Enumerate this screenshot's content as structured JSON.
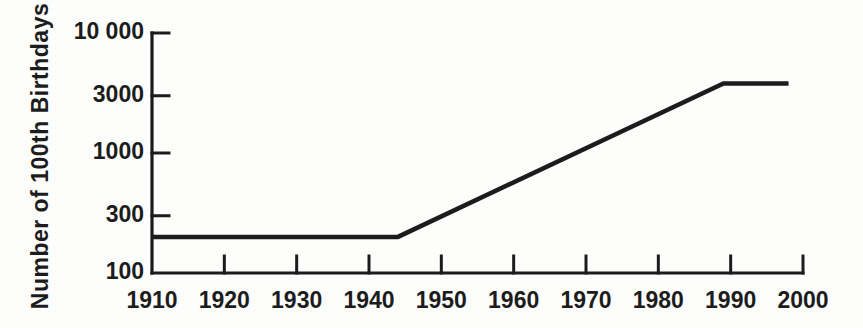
{
  "figure": {
    "background": "#fdfdfc",
    "ink_color": "#1c1c1c"
  },
  "chart_data": {
    "type": "line",
    "title": "",
    "xlabel": "",
    "ylabel": "Number of 100th Birthdays",
    "grid": false,
    "legend": false,
    "x_axis": {
      "scale": "linear",
      "range": [
        1910,
        2000
      ],
      "tick_values": [
        1910,
        1920,
        1930,
        1940,
        1950,
        1960,
        1970,
        1980,
        1990,
        2000
      ],
      "tick_labels": [
        "1910",
        "1920",
        "1930",
        "1940",
        "1950",
        "1960",
        "1970",
        "1980",
        "1990",
        "2000"
      ]
    },
    "y_axis": {
      "scale": "log",
      "range": [
        100,
        10000
      ],
      "tick_values": [
        100,
        300,
        1000,
        3000,
        10000
      ],
      "tick_labels": [
        "100",
        "300",
        "1000",
        "3000",
        "10 000"
      ]
    },
    "series": [
      {
        "name": "number-of-100th-birthdays",
        "points": [
          {
            "x": 1910,
            "y": 200
          },
          {
            "x": 1944,
            "y": 200
          },
          {
            "x": 1989,
            "y": 3800
          },
          {
            "x": 1998,
            "y": 3800
          }
        ]
      }
    ]
  }
}
